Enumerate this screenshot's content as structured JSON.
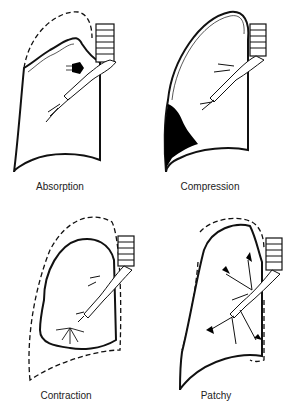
{
  "panels": [
    {
      "id": "absorption",
      "label": "Absorption"
    },
    {
      "id": "compression",
      "label": "Compression"
    },
    {
      "id": "contraction",
      "label": "Contraction"
    },
    {
      "id": "patchy",
      "label": "Patchy"
    }
  ],
  "colors": {
    "line": "#111111",
    "fill": "#ffffff",
    "shade": "#000000"
  }
}
